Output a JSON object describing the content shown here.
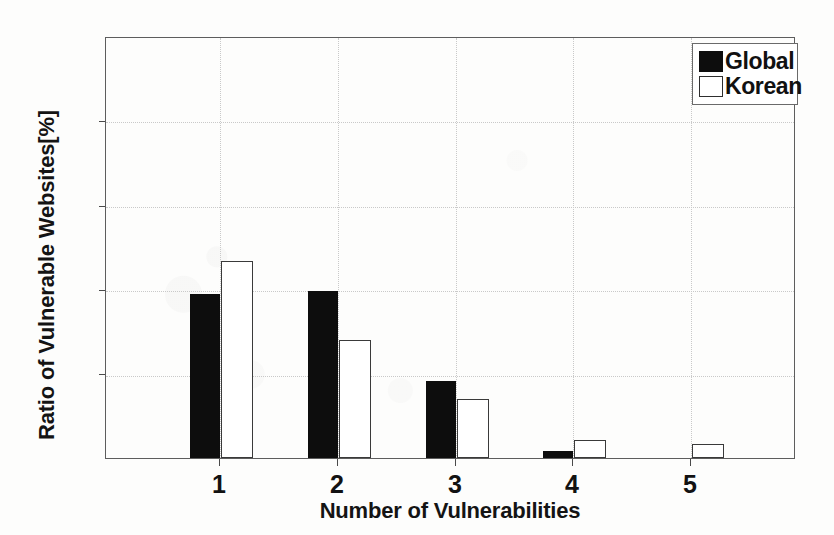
{
  "chart_data": {
    "type": "bar",
    "title": "",
    "xlabel": "Number of Vulnerabilities",
    "ylabel": "Ratio of Vulnerable Websites[%]",
    "categories": [
      "1",
      "2",
      "3",
      "4",
      "5"
    ],
    "series": [
      {
        "name": "Global",
        "color": "#0d0d0d",
        "values": [
          39.1,
          39.8,
          18.3,
          1.7,
          0
        ]
      },
      {
        "name": "Korean",
        "color": "#ffffff",
        "values": [
          46.9,
          28.2,
          14.0,
          4.3,
          3.4
        ]
      }
    ],
    "ylim": [
      0,
      100
    ],
    "yticks": [
      0,
      20,
      40,
      60,
      80,
      100
    ],
    "ytick_labels": [
      "0",
      "20",
      "40",
      "60",
      "80",
      "100"
    ],
    "xtick_labels": [
      "1",
      "2",
      "3",
      "4",
      "5"
    ],
    "xlim": [
      0.5,
      6.35
    ],
    "grid": true,
    "legend_position": "top-right",
    "legend": [
      "Global",
      "Korean"
    ]
  }
}
